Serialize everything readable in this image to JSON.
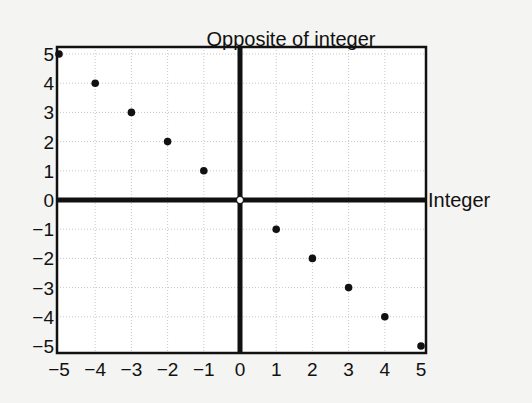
{
  "chart_data": {
    "type": "scatter",
    "title": "Opposite of integer",
    "xlabel": "Integer",
    "ylabel": "",
    "xlim": [
      -5,
      5
    ],
    "ylim": [
      -5,
      5
    ],
    "grid": true,
    "x_ticks": [
      -5,
      -4,
      -3,
      -2,
      -1,
      0,
      1,
      2,
      3,
      4,
      5
    ],
    "y_ticks": [
      -5,
      -4,
      -3,
      -2,
      -1,
      0,
      1,
      2,
      3,
      4,
      5
    ],
    "x_tick_labels": [
      "−5",
      "−4",
      "−3",
      "−2",
      "−1",
      "0",
      "1",
      "2",
      "3",
      "4",
      "5"
    ],
    "y_tick_labels": [
      "−5",
      "−4",
      "−3",
      "−2",
      "−1",
      "0",
      "1",
      "2",
      "3",
      "4",
      "5"
    ],
    "series": [
      {
        "name": "Opposite of integer",
        "x": [
          -5,
          -4,
          -3,
          -2,
          -1,
          0,
          1,
          2,
          3,
          4,
          5
        ],
        "y": [
          5,
          4,
          3,
          2,
          1,
          0,
          -1,
          -2,
          -3,
          -4,
          -5
        ],
        "markers": [
          "filled",
          "filled",
          "filled",
          "filled",
          "filled",
          "open",
          "filled",
          "filled",
          "filled",
          "filled",
          "filled"
        ]
      }
    ]
  },
  "colors": {
    "background": "#f4f4f2",
    "plot_area": "#ffffff",
    "axis": "#111111",
    "grid": "#c8c8c8",
    "marker": "#111111"
  }
}
